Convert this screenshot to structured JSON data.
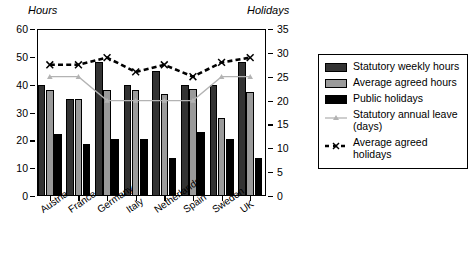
{
  "chart_data": {
    "type": "bar",
    "title": "",
    "subtitle": "",
    "xlabel": "",
    "ylabel": "Hours",
    "y2label": "Holidays",
    "grid": false,
    "legend_position": "right",
    "categories": [
      "Austria",
      "France",
      "Germany",
      "Italy",
      "Netherlands",
      "Spain",
      "Sweden",
      "UK"
    ],
    "ylim": [
      0,
      60
    ],
    "yticks": [
      0,
      10,
      20,
      30,
      40,
      50,
      60
    ],
    "y2lim": [
      0,
      35
    ],
    "y2ticks": [
      0,
      5,
      10,
      15,
      20,
      25,
      30,
      35
    ],
    "series": [
      {
        "name": "Statutory weekly hours",
        "type": "bar",
        "axis": "left",
        "color": "#333333",
        "values": [
          40,
          35,
          48,
          40,
          45,
          40,
          40,
          48
        ]
      },
      {
        "name": "Average agreed hours",
        "type": "bar",
        "axis": "left",
        "color": "#9a9a9a",
        "values": [
          38,
          35,
          38,
          38,
          36.5,
          38.5,
          28,
          37.5
        ]
      },
      {
        "name": "Public holidays",
        "type": "bar",
        "axis": "right",
        "color": "#000000",
        "values": [
          13,
          11,
          12,
          12,
          8,
          13.5,
          12,
          8
        ]
      },
      {
        "name": "Statutory annual leave (days)",
        "type": "line",
        "axis": "right",
        "color": "#b3b3b3",
        "marker": "triangle",
        "values": [
          25,
          25,
          20,
          20,
          20,
          20,
          25,
          25
        ]
      },
      {
        "name": "Average agreed holidays",
        "type": "line",
        "axis": "right",
        "color": "#000000",
        "marker": "x",
        "dashed": true,
        "values": [
          27.5,
          27.5,
          29,
          26,
          27.5,
          25,
          28,
          29
        ]
      }
    ]
  },
  "axes": {
    "left_title": "Hours",
    "right_title": "Holidays"
  },
  "legend": {
    "items": [
      {
        "label": "Statutory weekly hours",
        "swatch": "bar-dark"
      },
      {
        "label": "Average agreed hours",
        "swatch": "bar-gray"
      },
      {
        "label": "Public holidays",
        "swatch": "bar-black"
      },
      {
        "label": "Statutory annual leave (days)",
        "swatch": "line-gray-triangle"
      },
      {
        "label": "Average agreed holidays",
        "swatch": "line-black-dashed-x"
      }
    ]
  }
}
